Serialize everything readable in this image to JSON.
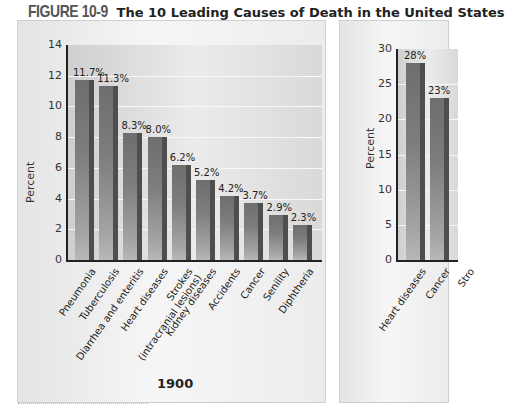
{
  "figure": {
    "number": "FIGURE 10-9",
    "title": "The 10 Leading Causes of Death in the United States"
  },
  "chart_data": [
    {
      "type": "bar",
      "title": "1900",
      "xlabel": "",
      "ylabel": "Percent",
      "ylim": [
        0,
        14
      ],
      "yticks": [
        0,
        2,
        4,
        6,
        8,
        10,
        12,
        14
      ],
      "grid": true,
      "categories": [
        "Pneumonia",
        "Tuberculosis",
        "Diarrhea and enteritis",
        "Heart diseases",
        "Strokes (intracranial lesions)",
        "Kidney diseases",
        "Accidents",
        "Cancer",
        "Senility",
        "Diphtheria"
      ],
      "values": [
        11.7,
        11.3,
        8.3,
        8.0,
        6.2,
        5.2,
        4.2,
        3.7,
        2.9,
        2.3
      ],
      "value_labels": [
        "11.7%",
        "11.3%",
        "8.3%",
        "8.0%",
        "6.2%",
        "5.2%",
        "4.2%",
        "3.7%",
        "2.9%",
        "2.3%"
      ]
    },
    {
      "type": "bar",
      "title": "",
      "xlabel": "",
      "ylabel": "Percent",
      "ylim": [
        0,
        30
      ],
      "yticks": [
        0,
        5,
        10,
        15,
        20,
        25,
        30
      ],
      "grid": true,
      "categories": [
        "Heart diseases",
        "Cancer",
        "Stro..."
      ],
      "values": [
        28,
        23
      ],
      "value_labels": [
        "28%",
        "23%"
      ],
      "note": "panel cropped at right edge"
    }
  ],
  "left": {
    "year": "1900",
    "ylabel": "Percent",
    "yticks": [
      "0",
      "2",
      "4",
      "6",
      "8",
      "10",
      "12",
      "14"
    ],
    "bars": [
      {
        "label": "Pneumonia",
        "value": 11.7,
        "text": "11.7%"
      },
      {
        "label": "Tuberculosis",
        "value": 11.3,
        "text": "11.3%"
      },
      {
        "label": "Diarrhea and enteritis",
        "value": 8.3,
        "text": "8.3%"
      },
      {
        "label": "Heart diseases",
        "value": 8.0,
        "text": "8.0%"
      },
      {
        "label": "Strokes\n(intracranial lesions)",
        "value": 6.2,
        "text": "6.2%"
      },
      {
        "label": "Kidney diseases",
        "value": 5.2,
        "text": "5.2%"
      },
      {
        "label": "Accidents",
        "value": 4.2,
        "text": "4.2%"
      },
      {
        "label": "Cancer",
        "value": 3.7,
        "text": "3.7%"
      },
      {
        "label": "Senility",
        "value": 2.9,
        "text": "2.9%"
      },
      {
        "label": "Diphtheria",
        "value": 2.3,
        "text": "2.3%"
      }
    ]
  },
  "right": {
    "ylabel": "Percent",
    "yticks": [
      "0",
      "5",
      "10",
      "15",
      "20",
      "25",
      "30"
    ],
    "bars": [
      {
        "label": "Heart diseases",
        "value": 28,
        "text": "28%"
      },
      {
        "label": "Cancer",
        "value": 23,
        "text": "23%"
      },
      {
        "label": "Stro",
        "value": 0,
        "text": ""
      }
    ]
  }
}
